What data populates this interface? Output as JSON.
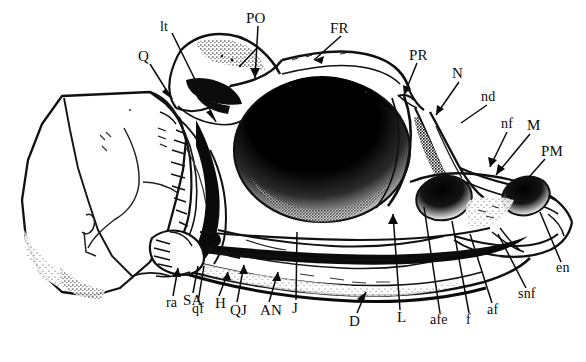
{
  "figure": {
    "kind": "anatomical-line-drawing",
    "style": "scanned halftone pen-and-ink illustration",
    "background_color": "#ffffff",
    "ink_color": "#000000",
    "width_px": 586,
    "height_px": 362
  },
  "labels": [
    {
      "id": "Q",
      "text": "Q",
      "x": 138,
      "y": 56,
      "case": "cap",
      "anchor": {
        "x": 171,
        "y": 101
      }
    },
    {
      "id": "lt",
      "text": "lt",
      "x": 160,
      "y": 27,
      "case": "low",
      "anchor": {
        "x": 215,
        "y": 124
      }
    },
    {
      "id": "PO",
      "text": "PO",
      "x": 247,
      "y": 18,
      "case": "cap",
      "anchor": {
        "x": 255,
        "y": 80
      }
    },
    {
      "id": "FR",
      "text": "FR",
      "x": 330,
      "y": 28,
      "case": "cap",
      "anchor": {
        "x": 315,
        "y": 59
      }
    },
    {
      "id": "PR",
      "text": "PR",
      "x": 409,
      "y": 55,
      "case": "cap",
      "anchor": {
        "x": 404,
        "y": 96
      }
    },
    {
      "id": "N",
      "text": "N",
      "x": 452,
      "y": 73,
      "case": "cap",
      "anchor": {
        "x": 437,
        "y": 116
      }
    },
    {
      "id": "nd",
      "text": "nd",
      "x": 481,
      "y": 97,
      "case": "low",
      "anchor": {
        "x": 462,
        "y": 123
      }
    },
    {
      "id": "nf",
      "text": "nf",
      "x": 501,
      "y": 124,
      "case": "low",
      "anchor": {
        "x": 490,
        "y": 166
      }
    },
    {
      "id": "M",
      "text": "M",
      "x": 527,
      "y": 125,
      "case": "cap",
      "anchor": {
        "x": 497,
        "y": 173
      }
    },
    {
      "id": "PM",
      "text": "PM",
      "x": 542,
      "y": 151,
      "case": "cap",
      "anchor": {
        "x": 523,
        "y": 185
      }
    },
    {
      "id": "en",
      "text": "en",
      "x": 556,
      "y": 268,
      "case": "low",
      "anchor": {
        "x": 540,
        "y": 213
      }
    },
    {
      "id": "snf",
      "text": "snf",
      "x": 519,
      "y": 294,
      "case": "low",
      "anchor": {
        "x": 497,
        "y": 236
      }
    },
    {
      "id": "af",
      "text": "af",
      "x": 487,
      "y": 310,
      "case": "low",
      "anchor": {
        "x": 470,
        "y": 235
      }
    },
    {
      "id": "f",
      "text": "f",
      "x": 466,
      "y": 320,
      "case": "low",
      "anchor": {
        "x": 452,
        "y": 222
      }
    },
    {
      "id": "afe",
      "text": "afe",
      "x": 432,
      "y": 320,
      "case": "low",
      "anchor": {
        "x": 424,
        "y": 208
      }
    },
    {
      "id": "L",
      "text": "L",
      "x": 397,
      "y": 317,
      "case": "cap",
      "anchor": {
        "x": 393,
        "y": 215
      }
    },
    {
      "id": "D",
      "text": "D",
      "x": 350,
      "y": 321,
      "case": "cap",
      "anchor": {
        "x": 365,
        "y": 293
      }
    },
    {
      "id": "J",
      "text": "J",
      "x": 292,
      "y": 308,
      "case": "cap",
      "anchor": {
        "x": 297,
        "y": 233
      }
    },
    {
      "id": "AN",
      "text": "AN",
      "x": 261,
      "y": 310,
      "case": "cap",
      "anchor": {
        "x": 277,
        "y": 274
      }
    },
    {
      "id": "QJ",
      "text": "QJ",
      "x": 231,
      "y": 310,
      "case": "cap",
      "anchor": {
        "x": 243,
        "y": 267
      }
    },
    {
      "id": "H",
      "text": "H",
      "x": 215,
      "y": 303,
      "case": "cap",
      "anchor": {
        "x": 227,
        "y": 273
      }
    },
    {
      "id": "qf",
      "text": "qf",
      "x": 193,
      "y": 309,
      "case": "low",
      "anchor": {
        "x": 203,
        "y": 267
      }
    },
    {
      "id": "SA",
      "text": "SA",
      "x": 184,
      "y": 300,
      "case": "cap",
      "anchor": {
        "x": 197,
        "y": 268
      }
    },
    {
      "id": "ra",
      "text": "ra",
      "x": 167,
      "y": 303,
      "case": "low",
      "anchor": {
        "x": 177,
        "y": 270
      }
    }
  ],
  "legend_terms": {
    "Q": "quadrate",
    "lt": "lateral temporal",
    "PO": "postorbital",
    "FR": "frontal",
    "PR": "prefrontal",
    "N": "nasal",
    "nd": "nasal duct",
    "nf": "narial fossa",
    "M": "maxilla",
    "PM": "premaxilla",
    "en": "external naris",
    "snf": "subnarial foramen",
    "af": "anterior foramen",
    "f": "foramen",
    "afe": "anterior fenestra",
    "L": "lacrimal",
    "D": "dentary",
    "J": "jugal",
    "AN": "angular",
    "QJ": "quadratojugal",
    "H": "hyoid",
    "qf": "quadrate foramen",
    "SA": "surangular",
    "ra": "retroarticular"
  }
}
